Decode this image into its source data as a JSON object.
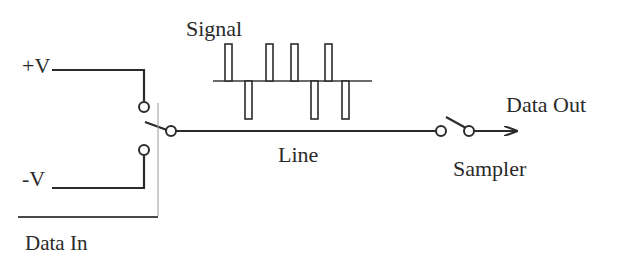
{
  "diagram": {
    "labels": {
      "plus_v": "+V",
      "minus_v": "-V",
      "data_in": "Data In",
      "signal": "Signal",
      "line": "Line",
      "data_out": "Data Out",
      "sampler": "Sampler"
    },
    "signal_pulses": [
      {
        "direction": "up"
      },
      {
        "direction": "down"
      },
      {
        "direction": "up"
      },
      {
        "direction": "up"
      },
      {
        "direction": "down"
      },
      {
        "direction": "up"
      },
      {
        "direction": "down"
      }
    ],
    "components": [
      {
        "name": "input-switch",
        "type": "SPDT switch",
        "connects": [
          "+V",
          "-V"
        ]
      },
      {
        "name": "transmission-line",
        "type": "line"
      },
      {
        "name": "sampler-switch",
        "type": "SPST switch"
      },
      {
        "name": "output-arrow",
        "type": "arrow",
        "target": "Data Out"
      }
    ],
    "colors": {
      "ink": "#2b2b2b",
      "guide": "#9a9a9a",
      "background": "#ffffff"
    }
  }
}
